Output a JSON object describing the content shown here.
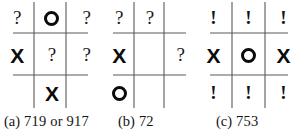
{
  "figure": {
    "background_color": "#ffffff",
    "ink_color": "#111111",
    "grid_line_color": "#5a5a5a"
  },
  "glyphs": {
    "x": "X",
    "o": "O",
    "question": "?",
    "exclamation": "!",
    "empty": ""
  },
  "panels": [
    {
      "id": "panel-a",
      "caption_label": "(a)",
      "caption_text": "719 or 917",
      "grid": [
        [
          "question",
          "o",
          "question"
        ],
        [
          "x",
          "question",
          "question"
        ],
        [
          "empty",
          "x",
          "empty"
        ]
      ]
    },
    {
      "id": "panel-b",
      "caption_label": "(b)",
      "caption_text": "72",
      "grid": [
        [
          "question",
          "question",
          "empty"
        ],
        [
          "x",
          "empty",
          "question"
        ],
        [
          "o",
          "empty",
          "empty"
        ]
      ]
    },
    {
      "id": "panel-c",
      "caption_label": "(c)",
      "caption_text": "753",
      "grid": [
        [
          "exclamation",
          "exclamation",
          "exclamation"
        ],
        [
          "x",
          "o",
          "x"
        ],
        [
          "exclamation",
          "exclamation",
          "exclamation"
        ]
      ]
    }
  ]
}
